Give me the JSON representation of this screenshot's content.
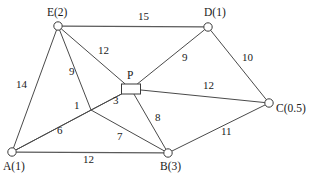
{
  "diagram": {
    "nodes": [
      {
        "id": "E",
        "label": "E(2)",
        "shape": "circle",
        "x": 58,
        "y": 26,
        "label_x": 47,
        "label_y": 7
      },
      {
        "id": "D",
        "label": "D(1)",
        "shape": "circle",
        "x": 208,
        "y": 27,
        "label_x": 204,
        "label_y": 7
      },
      {
        "id": "C",
        "label": "C(0.5)",
        "shape": "circle",
        "x": 269,
        "y": 103,
        "label_x": 276,
        "label_y": 103
      },
      {
        "id": "A",
        "label": "A(1)",
        "shape": "circle",
        "x": 12,
        "y": 152,
        "label_x": 3,
        "label_y": 161
      },
      {
        "id": "B",
        "label": "B(3)",
        "shape": "circle",
        "x": 168,
        "y": 153,
        "label_x": 160,
        "label_y": 161
      },
      {
        "id": "P",
        "label": "P",
        "shape": "rect",
        "x": 131,
        "y": 89,
        "label_x": 127,
        "label_y": 70
      }
    ],
    "junction": {
      "id": "J",
      "x": 91,
      "y": 110
    },
    "edges": [
      {
        "id": "E-D",
        "from": "E",
        "to": "D",
        "weight": "15",
        "label_x": 138,
        "label_y": 11
      },
      {
        "id": "E-A",
        "from": "E",
        "to": "A",
        "weight": "14",
        "label_x": 16,
        "label_y": 79
      },
      {
        "id": "E-J",
        "from": "E",
        "to": "J",
        "weight": "9",
        "label_x": 69,
        "label_y": 66
      },
      {
        "id": "E-P",
        "from": "E",
        "to": "P",
        "weight": "12",
        "label_x": 98,
        "label_y": 45
      },
      {
        "id": "D-P",
        "from": "D",
        "to": "P",
        "weight": "9",
        "label_x": 182,
        "label_y": 52
      },
      {
        "id": "D-C",
        "from": "D",
        "to": "C",
        "weight": "10",
        "label_x": 242,
        "label_y": 52
      },
      {
        "id": "P-C",
        "from": "P",
        "to": "C",
        "weight": "12",
        "label_x": 203,
        "label_y": 80
      },
      {
        "id": "J-P",
        "from": "J",
        "to": "P",
        "weight": "3",
        "label_x": 113,
        "label_y": 95
      },
      {
        "id": "A-J",
        "from": "A",
        "to": "J",
        "weight": "1",
        "label_x": 74,
        "label_y": 100
      },
      {
        "id": "A-P",
        "from": "A",
        "to": "P",
        "weight": "6",
        "label_x": 57,
        "label_y": 125
      },
      {
        "id": "J-B",
        "from": "J",
        "to": "B",
        "weight": "7",
        "label_x": 117,
        "label_y": 131
      },
      {
        "id": "P-B",
        "from": "P",
        "to": "B",
        "weight": "8",
        "label_x": 155,
        "label_y": 112
      },
      {
        "id": "A-B",
        "from": "A",
        "to": "B",
        "weight": "12",
        "label_x": 83,
        "label_y": 154
      },
      {
        "id": "B-C",
        "from": "B",
        "to": "C",
        "weight": "11",
        "label_x": 221,
        "label_y": 126
      }
    ],
    "style": {
      "line_color": "#4a4a4a",
      "node_fill": "#ffffff",
      "node_stroke": "#3a3a3a",
      "text_color": "#1a1a1a",
      "background": "#ffffff"
    }
  }
}
